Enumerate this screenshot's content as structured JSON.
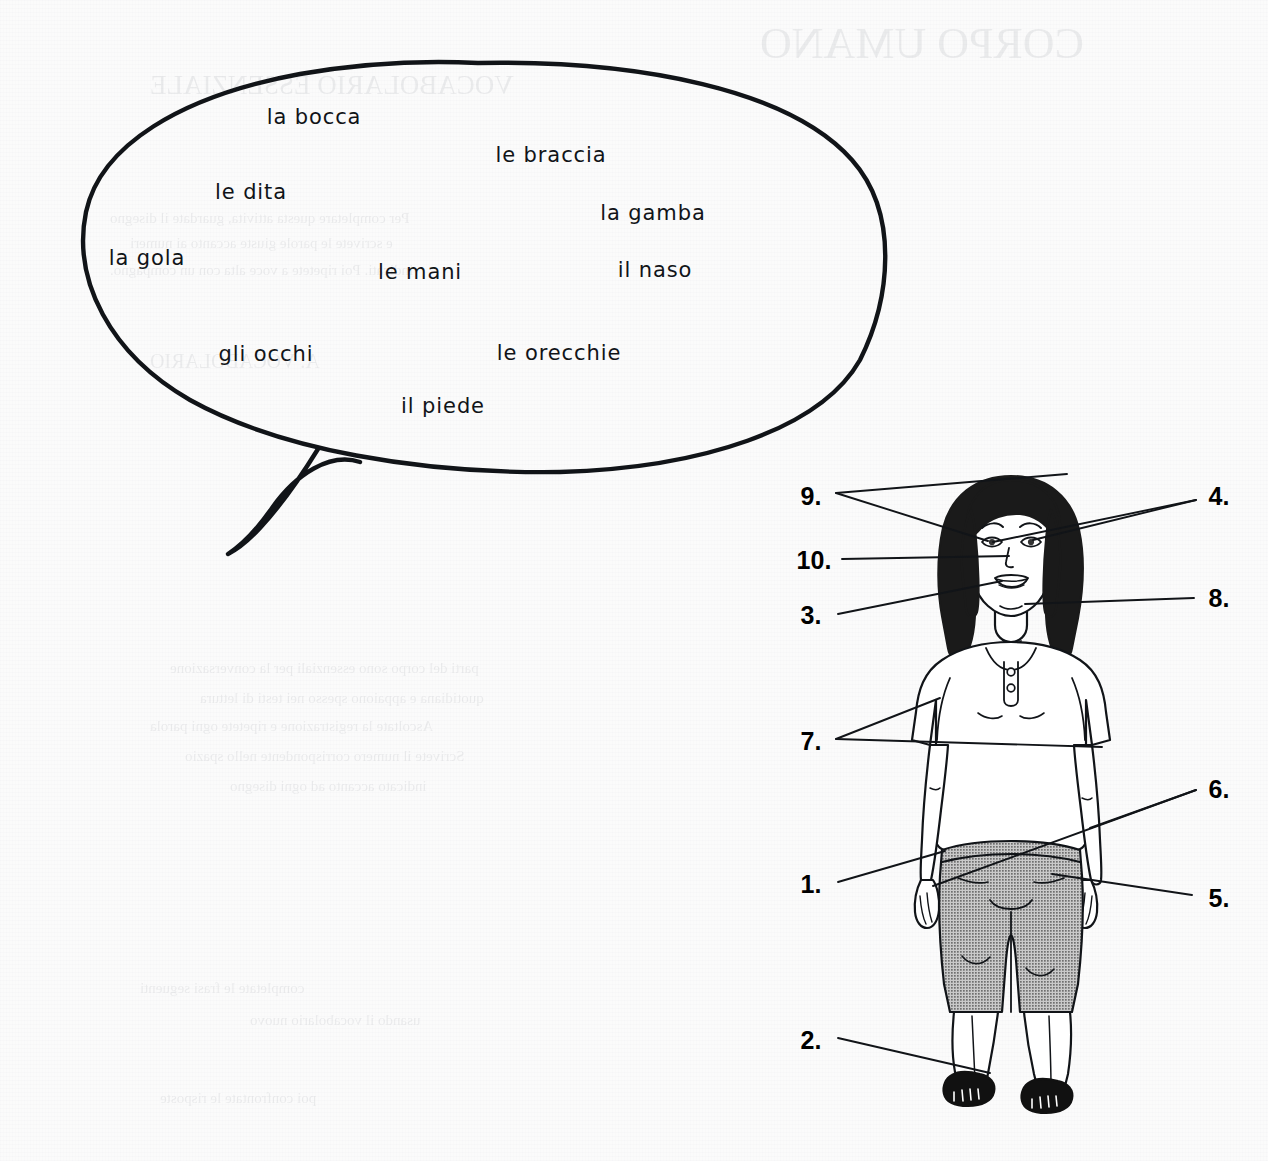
{
  "page": {
    "background_color": "#fbfbfb",
    "ink_color": "#111418",
    "width": 1268,
    "height": 1161
  },
  "speech_bubble": {
    "name": "word-bank-speech-bubble",
    "outline_color": "#111418",
    "words": [
      {
        "id": "la-bocca",
        "text": "la bocca",
        "x": 314,
        "y": 117
      },
      {
        "id": "le-braccia",
        "text": "le braccia",
        "x": 551,
        "y": 155
      },
      {
        "id": "le-dita",
        "text": "le dita",
        "x": 251,
        "y": 192
      },
      {
        "id": "la-gamba",
        "text": "la gamba",
        "x": 653,
        "y": 213
      },
      {
        "id": "la-gola",
        "text": "la gola",
        "x": 147,
        "y": 258
      },
      {
        "id": "le-mani",
        "text": "le mani",
        "x": 420,
        "y": 272
      },
      {
        "id": "il-naso",
        "text": "il naso",
        "x": 655,
        "y": 270
      },
      {
        "id": "gli-occhi",
        "text": "gli occhi",
        "x": 266,
        "y": 354
      },
      {
        "id": "le-orecchie",
        "text": "le orecchie",
        "x": 559,
        "y": 353
      },
      {
        "id": "il-piede",
        "text": "il piede",
        "x": 443,
        "y": 406
      }
    ]
  },
  "figure": {
    "name": "labeled-woman-diagram",
    "hair_color": "#1a1a1a",
    "skin_color": "#ffffff",
    "top_color": "#ffffff",
    "pants_color": "#9a9a9a",
    "sandal_color": "#111111",
    "outline_color": "#111418"
  },
  "callouts": [
    {
      "id": "callout-9",
      "label": "9.",
      "x": 811,
      "y": 496,
      "side": "left",
      "points": 2
    },
    {
      "id": "callout-10",
      "label": "10.",
      "x": 814,
      "y": 560,
      "side": "left",
      "points": 1
    },
    {
      "id": "callout-3",
      "label": "3.",
      "x": 811,
      "y": 615,
      "side": "left",
      "points": 1
    },
    {
      "id": "callout-7",
      "label": "7.",
      "x": 811,
      "y": 741,
      "side": "left",
      "points": 2
    },
    {
      "id": "callout-1",
      "label": "1.",
      "x": 811,
      "y": 884,
      "side": "left",
      "points": 1
    },
    {
      "id": "callout-2",
      "label": "2.",
      "x": 811,
      "y": 1040,
      "side": "left",
      "points": 1
    },
    {
      "id": "callout-4",
      "label": "4.",
      "x": 1219,
      "y": 496,
      "side": "right",
      "points": 2
    },
    {
      "id": "callout-8",
      "label": "8.",
      "x": 1219,
      "y": 598,
      "side": "right",
      "points": 1
    },
    {
      "id": "callout-6",
      "label": "6.",
      "x": 1219,
      "y": 789,
      "side": "right",
      "points": 2
    },
    {
      "id": "callout-5",
      "label": "5.",
      "x": 1219,
      "y": 898,
      "side": "right",
      "points": 1
    }
  ],
  "ghost_text": [
    {
      "text": "VOCABOLARIO ESSENZIALE",
      "x": 150,
      "y": 70,
      "size": 27
    },
    {
      "text": "CORPO UMANO",
      "x": 760,
      "y": 18,
      "size": 44
    },
    {
      "text": "Per completare questa attivita, guardate il disegno",
      "x": 110,
      "y": 210,
      "size": 15
    },
    {
      "text": "e scrivete le parole giuste accanto ai numeri",
      "x": 130,
      "y": 235,
      "size": 15
    },
    {
      "text": "indicati. Poi ripetete a voce alta con un compagno.",
      "x": 110,
      "y": 262,
      "size": 15
    },
    {
      "text": "A. VOCABOLARIO",
      "x": 150,
      "y": 350,
      "size": 20
    },
    {
      "text": "parti del corpo sono essenziali per la conversazione",
      "x": 170,
      "y": 660,
      "size": 15
    },
    {
      "text": "quotidiana e appaiono spesso nei testi di lettura",
      "x": 200,
      "y": 690,
      "size": 15
    },
    {
      "text": "Ascoltate la registrazione e ripetete ogni parola",
      "x": 150,
      "y": 718,
      "size": 15
    },
    {
      "text": "Scrivete il numero corrispondente nello spazio",
      "x": 185,
      "y": 748,
      "size": 15
    },
    {
      "text": "indicato accanto ad ogni disegno",
      "x": 230,
      "y": 778,
      "size": 15
    },
    {
      "text": "completate le frasi seguenti",
      "x": 140,
      "y": 980,
      "size": 15
    },
    {
      "text": "usando il vocabolario nuovo",
      "x": 250,
      "y": 1012,
      "size": 15
    },
    {
      "text": "poi confrontate le risposte",
      "x": 160,
      "y": 1090,
      "size": 15
    }
  ]
}
